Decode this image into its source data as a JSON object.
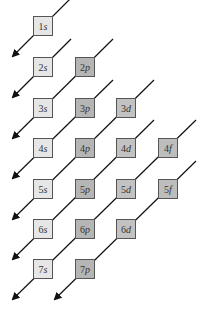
{
  "diagram": {
    "title": "",
    "orbitals": [
      {
        "id": "1s",
        "n": "1",
        "l": "s",
        "col": 0,
        "row": 0
      },
      {
        "id": "2s",
        "n": "2",
        "l": "s",
        "col": 0,
        "row": 1
      },
      {
        "id": "2p",
        "n": "2",
        "l": "p",
        "col": 1,
        "row": 1
      },
      {
        "id": "3s",
        "n": "3",
        "l": "s",
        "col": 0,
        "row": 2
      },
      {
        "id": "3p",
        "n": "3",
        "l": "p",
        "col": 1,
        "row": 2
      },
      {
        "id": "3d",
        "n": "3",
        "l": "d",
        "col": 2,
        "row": 2
      },
      {
        "id": "4s",
        "n": "4",
        "l": "s",
        "col": 0,
        "row": 3
      },
      {
        "id": "4p",
        "n": "4",
        "l": "p",
        "col": 1,
        "row": 3
      },
      {
        "id": "4d",
        "n": "4",
        "l": "d",
        "col": 2,
        "row": 3
      },
      {
        "id": "4f",
        "n": "4",
        "l": "f",
        "col": 3,
        "row": 3
      },
      {
        "id": "5s",
        "n": "5",
        "l": "s",
        "col": 0,
        "row": 4
      },
      {
        "id": "5p",
        "n": "5",
        "l": "p",
        "col": 1,
        "row": 4
      },
      {
        "id": "5d",
        "n": "5",
        "l": "d",
        "col": 2,
        "row": 4
      },
      {
        "id": "5f",
        "n": "5",
        "l": "f",
        "col": 3,
        "row": 4
      },
      {
        "id": "6s",
        "n": "6",
        "l": "s",
        "col": 0,
        "row": 5
      },
      {
        "id": "6p",
        "n": "6",
        "l": "p",
        "col": 1,
        "row": 5
      },
      {
        "id": "6d",
        "n": "6",
        "l": "d",
        "col": 2,
        "row": 5
      },
      {
        "id": "7s",
        "n": "7",
        "l": "s",
        "col": 0,
        "row": 6
      },
      {
        "id": "7p",
        "n": "7",
        "l": "p",
        "col": 1,
        "row": 6
      }
    ],
    "diagonals": [
      [
        "1s"
      ],
      [
        "2s"
      ],
      [
        "2p",
        "3s"
      ],
      [
        "3p",
        "4s"
      ],
      [
        "3d",
        "4p",
        "5s"
      ],
      [
        "4d",
        "5p",
        "6s"
      ],
      [
        "4f",
        "5d",
        "6p",
        "7s"
      ],
      [
        "5f",
        "6d",
        "7p"
      ]
    ],
    "colors": {
      "s": "#e6e6e6",
      "p": "#b5b5b5",
      "d": "#c2c2c2",
      "f": "#bdbdbd",
      "line": "#111111",
      "border": "#555555"
    }
  }
}
